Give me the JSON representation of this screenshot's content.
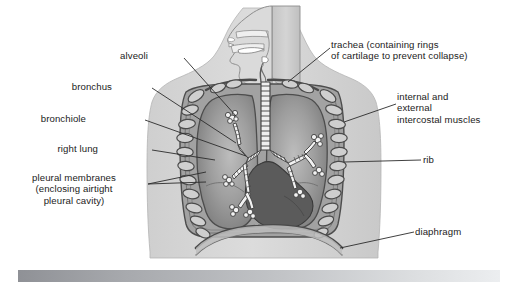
{
  "figure": {
    "type": "anatomical-diagram",
    "style": "grayscale textbook line drawing",
    "labels": [
      {
        "id": "alveoli",
        "text": "alveoli",
        "align": "right",
        "x": 147,
        "y": 55,
        "target_x": 236,
        "target_y": 118
      },
      {
        "id": "bronchus",
        "text": "bronchus",
        "align": "right",
        "x": 110,
        "y": 86,
        "target_x": 238,
        "target_y": 143
      },
      {
        "id": "bronchiole",
        "text": "bronchiole",
        "align": "right",
        "x": 84,
        "y": 118,
        "target_x": 245,
        "target_y": 155
      },
      {
        "id": "right-lung",
        "text": "right lung",
        "align": "right",
        "x": 96,
        "y": 148,
        "target_x": 215,
        "target_y": 160
      },
      {
        "id": "pleural-membranes",
        "text": "pleural membranes\n(enclosing airtight\npleural cavity)",
        "align": "right",
        "x": 12,
        "y": 178,
        "target_x": 205,
        "target_y": 180
      },
      {
        "id": "trachea",
        "text": "trachea (containing rings\nof cartilage to prevent collapse)",
        "align": "left",
        "x": 332,
        "y": 44,
        "target_x": 288,
        "target_y": 82
      },
      {
        "id": "intercostal-muscles",
        "text": "internal and\nexternal\nintercostal muscles",
        "align": "left",
        "x": 398,
        "y": 96,
        "target_x": 345,
        "target_y": 123
      },
      {
        "id": "rib",
        "text": "rib",
        "align": "left",
        "x": 424,
        "y": 158,
        "target_x": 348,
        "target_y": 160
      },
      {
        "id": "diaphragm",
        "text": "diaphragm",
        "align": "left",
        "x": 416,
        "y": 230,
        "target_x": 340,
        "target_y": 246
      }
    ],
    "colors": {
      "body_silhouette": "#d7d7d7",
      "chest_cavity": "#9a9a9a",
      "lung_tissue": "#8a8a8a",
      "heart": "#5a5a5a",
      "rib_outline": "#4a4a4a",
      "outline": "#3a3a3a",
      "label_text": "#1b1b1b",
      "leader_line": "#2b2b2b",
      "bottom_bar_dark": "#8f9196",
      "bottom_bar_light": "#eceef0"
    },
    "parts": [
      "nasal cavity",
      "mouth",
      "tongue",
      "epiglottis",
      "larynx",
      "trachea with cartilage rings",
      "left bronchus",
      "right bronchus",
      "bronchioles",
      "alveoli clusters",
      "left lung",
      "right lung",
      "heart",
      "ribs",
      "intercostal muscles",
      "pleural membranes",
      "diaphragm"
    ]
  },
  "bottom_bar": {
    "label": "partially visible caption bar",
    "text": ""
  }
}
